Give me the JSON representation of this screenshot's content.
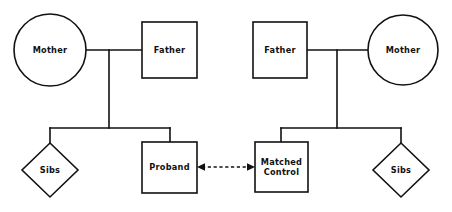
{
  "diagram": {
    "colors": {
      "background": "#ffffff",
      "stroke": "#111111",
      "fill": "#ffffff"
    },
    "families": [
      {
        "id": "proband-family",
        "side": "left",
        "parents": [
          {
            "id": "left-mother",
            "label": "Mother",
            "shape": "circle",
            "sex": "female"
          },
          {
            "id": "left-father",
            "label": "Father",
            "shape": "square",
            "sex": "male"
          }
        ],
        "children": [
          {
            "id": "left-sibs",
            "label": "Sibs",
            "shape": "diamond",
            "sex": "unspecified"
          },
          {
            "id": "proband",
            "label": "Proband",
            "shape": "square",
            "sex": "male"
          }
        ]
      },
      {
        "id": "control-family",
        "side": "right",
        "parents": [
          {
            "id": "right-father",
            "label": "Father",
            "shape": "square",
            "sex": "male"
          },
          {
            "id": "right-mother",
            "label": "Mother",
            "shape": "circle",
            "sex": "female"
          }
        ],
        "children": [
          {
            "id": "matched-control",
            "label": "Matched\nControl",
            "label_line1": "Matched",
            "label_line2": "Control",
            "shape": "square",
            "sex": "male"
          },
          {
            "id": "right-sibs",
            "label": "Sibs",
            "shape": "diamond",
            "sex": "unspecified"
          }
        ]
      }
    ],
    "comparison_link": {
      "id": "proband-control-link",
      "from": "proband",
      "to": "matched-control",
      "style": "dashed",
      "arrows": "both",
      "label": ""
    }
  }
}
